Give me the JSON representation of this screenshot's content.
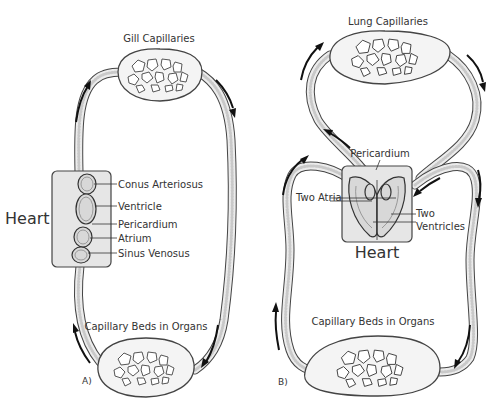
{
  "diagram": {
    "panel_a": {
      "label": "A)",
      "top_capillaries": "Gill Capillaries",
      "bottom_capillaries": "Capillary Beds in Organs",
      "heart_label": "Heart",
      "heart_parts": [
        "Conus Arteriosus",
        "Ventricle",
        "Pericardium",
        "Atrium",
        "Sinus Venosus"
      ]
    },
    "panel_b": {
      "label": "B)",
      "top_capillaries": "Lung Capillaries",
      "bottom_capillaries": "Capillary Beds in Organs",
      "heart_label": "Heart",
      "pericardium_label": "Pericardium",
      "atria_label": "Two Atria",
      "ventricles_label_line1": "Two",
      "ventricles_label_line2": "Ventricles"
    }
  }
}
